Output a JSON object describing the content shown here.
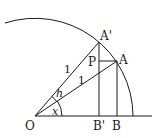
{
  "diagram": {
    "labels": {
      "O": "O",
      "A_prime": "A'",
      "A": "A",
      "P": "P",
      "B_prime": "B'",
      "B": "B",
      "len1_upper": "1",
      "len1_lower": "1",
      "angle_h": "h",
      "angle_x": "x"
    },
    "stroke_color": "#1a1a1a",
    "background": "#ffffff"
  }
}
